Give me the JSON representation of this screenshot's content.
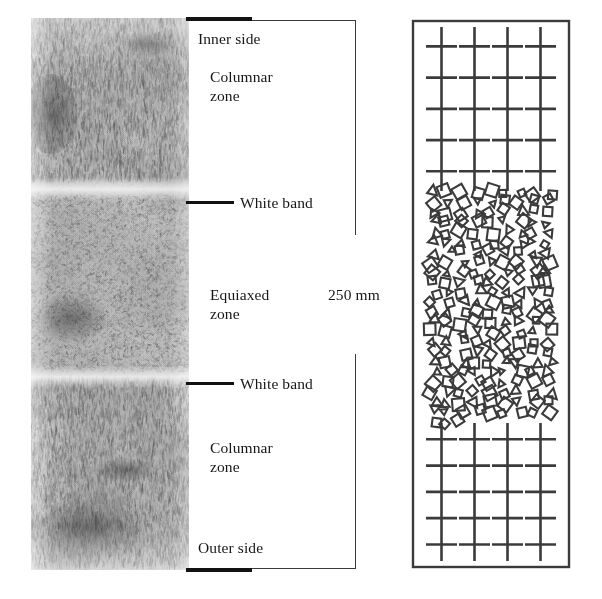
{
  "figure": {
    "type": "cast-structure-cross-section",
    "panels": [
      "micrograph",
      "annotations",
      "schematic"
    ]
  },
  "micrograph": {
    "name": "etched-macrograph",
    "description": "Grayscale etched cross-section of a continuously cast slab showing columnar and equiaxed solidification zones",
    "bands": [
      {
        "label": "columnar zone top",
        "from_pct": 0,
        "to_pct": 30
      },
      {
        "label": "white band top",
        "from_pct": 30,
        "to_pct": 32
      },
      {
        "label": "equiaxed zone",
        "from_pct": 32,
        "to_pct": 64
      },
      {
        "label": "white band bottom",
        "from_pct": 64,
        "to_pct": 66
      },
      {
        "label": "columnar zone bottom",
        "from_pct": 66,
        "to_pct": 100
      }
    ]
  },
  "annotations": {
    "inner_side": "Inner side",
    "columnar_zone_top": "Columnar\nzone",
    "white_band_top": "White band",
    "equiaxed_zone": "Equiaxed\nzone",
    "dimension": "250 mm",
    "white_band_bottom": "White band",
    "columnar_zone_bottom": "Columnar\nzone",
    "outer_side": "Outer side"
  },
  "schematic": {
    "name": "grain-structure-schematic",
    "columnar_top": {
      "stems": 4,
      "arm_rows": 5,
      "description": "Vertical dendrite stems with horizontal secondary arms"
    },
    "equiaxed": {
      "description": "Randomly oriented small equiaxed grains drawn as tilted squares and triangles",
      "grain_count": 210
    },
    "columnar_bottom": {
      "stems": 4,
      "arm_rows": 5,
      "description": "Vertical dendrite stems with horizontal secondary arms"
    }
  },
  "colors": {
    "ink": "#161616",
    "line": "#3b3b3b",
    "heavy_rule": "#111111",
    "background": "#ffffff"
  }
}
